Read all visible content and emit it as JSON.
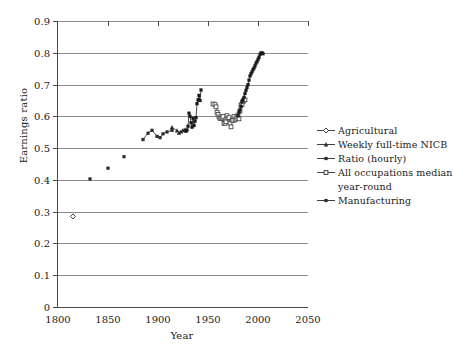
{
  "chart_data": {
    "type": "scatter",
    "title": "",
    "xlabel": "Year",
    "ylabel": "Earnings ratio",
    "xlim": [
      1800,
      2050
    ],
    "ylim": [
      0,
      0.9
    ],
    "xticks": [
      1800,
      1850,
      1900,
      1950,
      2000,
      2050
    ],
    "xticklabels": [
      "1800",
      "1850",
      "1900",
      "1950",
      "2000",
      "2050"
    ],
    "yticks": [
      0,
      0.1,
      0.2,
      0.3,
      0.4,
      0.5,
      0.6,
      0.7,
      0.8,
      0.9
    ],
    "yticklabels": [
      "0",
      "0.1",
      "0.2",
      "0.3",
      "0.4",
      "0.5",
      "0.6",
      "0.7",
      "0.8",
      "0.9"
    ],
    "grid": "horizontal",
    "legend_position": "right",
    "series": [
      {
        "name": "Agricultural",
        "marker": "open-diamond",
        "line": false,
        "color": "#2b2b2b",
        "points": [
          [
            1815,
            0.285
          ]
        ]
      },
      {
        "name": "Weekly full-time NICB",
        "marker": "filled-triangle",
        "line": true,
        "color": "#2b2b2b",
        "points": [
          [
            1914,
            0.565
          ],
          [
            1919,
            0.555
          ],
          [
            1921,
            0.548
          ],
          [
            1923,
            0.552
          ],
          [
            1925,
            0.556
          ],
          [
            1927,
            0.558
          ]
        ]
      },
      {
        "name": "Ratio (hourly)",
        "marker": "filled-square",
        "line": true,
        "color": "#2b2b2b",
        "points": [
          [
            1832,
            0.403
          ],
          [
            1850,
            0.437
          ],
          [
            1866,
            0.473
          ],
          [
            1885,
            0.527
          ],
          [
            1890,
            0.547
          ],
          [
            1894,
            0.556
          ],
          [
            1899,
            0.537
          ],
          [
            1902,
            0.533
          ],
          [
            1905,
            0.545
          ],
          [
            1909,
            0.551
          ],
          [
            1914,
            0.556
          ]
        ]
      },
      {
        "name": "All occupations median year-round",
        "marker": "open-square",
        "line": true,
        "color": "#4a4a4a",
        "points": [
          [
            1955,
            0.639
          ],
          [
            1957,
            0.637
          ],
          [
            1958,
            0.63
          ],
          [
            1959,
            0.613
          ],
          [
            1960,
            0.606
          ],
          [
            1961,
            0.598
          ],
          [
            1962,
            0.594
          ],
          [
            1963,
            0.593
          ],
          [
            1964,
            0.595
          ],
          [
            1965,
            0.6
          ],
          [
            1966,
            0.578
          ],
          [
            1967,
            0.578
          ],
          [
            1968,
            0.583
          ],
          [
            1969,
            0.602
          ],
          [
            1970,
            0.594
          ],
          [
            1971,
            0.596
          ],
          [
            1972,
            0.578
          ],
          [
            1973,
            0.567
          ],
          [
            1974,
            0.588
          ],
          [
            1975,
            0.587
          ],
          [
            1976,
            0.6
          ],
          [
            1977,
            0.589
          ],
          [
            1978,
            0.594
          ],
          [
            1979,
            0.598
          ],
          [
            1980,
            0.604
          ],
          [
            1981,
            0.592
          ],
          [
            1982,
            0.617
          ],
          [
            1983,
            0.636
          ],
          [
            1984,
            0.637
          ],
          [
            1985,
            0.646
          ],
          [
            1986,
            0.651
          ],
          [
            1987,
            0.652
          ]
        ]
      },
      {
        "name": "Manufacturing",
        "marker": "filled-square",
        "line": true,
        "color": "#1a1a1a",
        "points": [
          [
            1928,
            0.553
          ],
          [
            1929,
            0.557
          ],
          [
            1930,
            0.569
          ],
          [
            1931,
            0.61
          ],
          [
            1932,
            0.6
          ],
          [
            1933,
            0.58
          ],
          [
            1934,
            0.566
          ],
          [
            1935,
            0.594
          ],
          [
            1936,
            0.571
          ],
          [
            1937,
            0.585
          ],
          [
            1938,
            0.596
          ],
          [
            1939,
            0.64
          ],
          [
            1940,
            0.652
          ],
          [
            1941,
            0.666
          ],
          [
            1942,
            0.65
          ],
          [
            1943,
            0.683
          ],
          [
            1980,
            0.602
          ],
          [
            1981,
            0.613
          ],
          [
            1982,
            0.62
          ],
          [
            1983,
            0.631
          ],
          [
            1984,
            0.647
          ],
          [
            1985,
            0.652
          ],
          [
            1986,
            0.66
          ],
          [
            1987,
            0.672
          ],
          [
            1988,
            0.682
          ],
          [
            1989,
            0.691
          ],
          [
            1990,
            0.7
          ],
          [
            1991,
            0.714
          ],
          [
            1992,
            0.727
          ],
          [
            1993,
            0.734
          ],
          [
            1994,
            0.74
          ],
          [
            1995,
            0.747
          ],
          [
            1996,
            0.752
          ],
          [
            1997,
            0.759
          ],
          [
            1998,
            0.767
          ],
          [
            1999,
            0.772
          ],
          [
            2000,
            0.779
          ],
          [
            2001,
            0.786
          ],
          [
            2002,
            0.795
          ],
          [
            2003,
            0.799
          ],
          [
            2004,
            0.8
          ],
          [
            2005,
            0.797
          ]
        ]
      }
    ]
  },
  "legend": {
    "entries": [
      {
        "label": "Agricultural",
        "marker": "open-diamond"
      },
      {
        "label": "Weekly full-time NICB",
        "marker": "filled-triangle"
      },
      {
        "label": "Ratio (hourly)",
        "marker": "filled-square"
      },
      {
        "label": "All occupations median",
        "marker": "open-square"
      },
      {
        "label": "year-round",
        "marker": "none"
      },
      {
        "label": "Manufacturing",
        "marker": "filled-square"
      }
    ]
  }
}
